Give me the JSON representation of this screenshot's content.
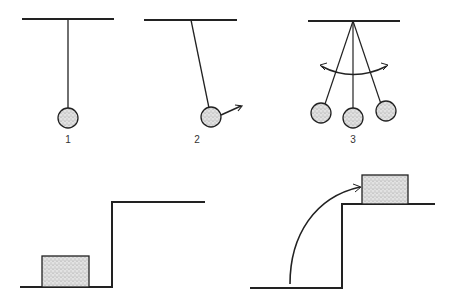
{
  "colors": {
    "ink": "#222222",
    "fill": "#d9d9d9",
    "speckle": "#888888",
    "background": "#ffffff"
  },
  "panels": [
    {
      "id": "pendulum-rest",
      "label": "1",
      "description": "Pendulum hanging at rest"
    },
    {
      "id": "pendulum-displaced",
      "label": "2",
      "description": "Pendulum displaced with velocity arrow"
    },
    {
      "id": "pendulum-swing",
      "label": "3",
      "description": "Pendulum swinging between extremes with double-headed arc arrow"
    },
    {
      "id": "block-on-ground",
      "label": "",
      "description": "Block resting on lower level near step"
    },
    {
      "id": "block-raised",
      "label": "",
      "description": "Block lifted onto upper step, curved arrow showing path"
    }
  ]
}
